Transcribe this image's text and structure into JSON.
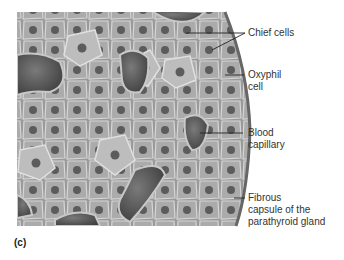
{
  "figure": {
    "panel_label": "(c)"
  },
  "labels": [
    {
      "id": "chief",
      "lines": [
        "Chief cells"
      ]
    },
    {
      "id": "oxyphil",
      "lines": [
        "Oxyphil",
        "cell"
      ]
    },
    {
      "id": "capillary",
      "lines": [
        "Blood",
        "capillary"
      ]
    },
    {
      "id": "capsule",
      "lines": [
        "Fibrous",
        "capsule of the",
        "parathyroid gland"
      ]
    }
  ],
  "colors": {
    "tissue_base": "#8e8e8e",
    "cell_fill": "#a9a9a9",
    "cell_border": "#d8d8d8",
    "nucleus": "#5a5a5a",
    "capsule": "#777777",
    "capillary": "#4a4a4a",
    "label_text": "#333333"
  }
}
